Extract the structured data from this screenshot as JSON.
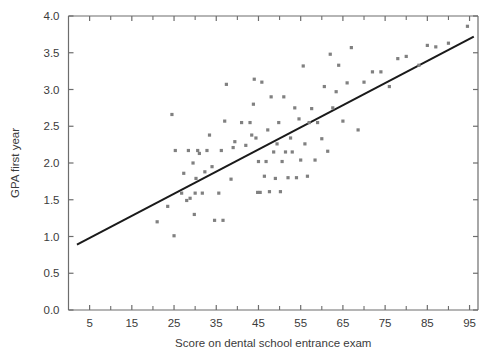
{
  "chart_data": {
    "type": "scatter",
    "title": "",
    "xlabel": "Score on dental school entrance exam",
    "ylabel": "GPA first year",
    "xlim": [
      0,
      97
    ],
    "ylim": [
      0.0,
      4.0
    ],
    "grid": false,
    "legend": null,
    "x_ticks_major": [
      5,
      15,
      25,
      35,
      45,
      55,
      65,
      75,
      85,
      95
    ],
    "x_tick_labels": [
      "5",
      "15",
      "25",
      "35",
      "45",
      "55",
      "65",
      "75",
      "85",
      "95"
    ],
    "x_ticks_minor": [
      10,
      20,
      30,
      40,
      50,
      60,
      70,
      80,
      90
    ],
    "y_ticks": [
      0.0,
      0.5,
      1.0,
      1.5,
      2.0,
      2.5,
      3.0,
      3.5,
      4.0
    ],
    "y_tick_labels": [
      "0.0",
      "0.5",
      "1.0",
      "1.5",
      "2.0",
      "2.5",
      "3.0",
      "3.5",
      "4.0"
    ],
    "point_color": "#808080",
    "line_color": "#1a1a1a",
    "axis_color": "#6d6d6d",
    "trendline": {
      "label": "least squares regression line",
      "x_start": 2.0,
      "y_start": 0.89,
      "x_end": 96.0,
      "y_end": 3.72
    },
    "points": [
      {
        "x": 21.0,
        "y": 1.2
      },
      {
        "x": 23.5,
        "y": 1.41
      },
      {
        "x": 24.5,
        "y": 2.66
      },
      {
        "x": 25.0,
        "y": 1.01
      },
      {
        "x": 25.3,
        "y": 2.17
      },
      {
        "x": 26.8,
        "y": 1.59
      },
      {
        "x": 27.3,
        "y": 1.86
      },
      {
        "x": 28.0,
        "y": 1.49
      },
      {
        "x": 28.4,
        "y": 2.17
      },
      {
        "x": 28.8,
        "y": 1.52
      },
      {
        "x": 29.5,
        "y": 2.0
      },
      {
        "x": 29.8,
        "y": 1.3
      },
      {
        "x": 30.0,
        "y": 1.59
      },
      {
        "x": 30.2,
        "y": 1.79
      },
      {
        "x": 30.6,
        "y": 2.17
      },
      {
        "x": 31.0,
        "y": 2.13
      },
      {
        "x": 31.7,
        "y": 1.59
      },
      {
        "x": 32.3,
        "y": 1.88
      },
      {
        "x": 32.8,
        "y": 2.17
      },
      {
        "x": 33.4,
        "y": 2.38
      },
      {
        "x": 34.0,
        "y": 1.95
      },
      {
        "x": 34.6,
        "y": 1.22
      },
      {
        "x": 35.6,
        "y": 1.59
      },
      {
        "x": 36.2,
        "y": 2.17
      },
      {
        "x": 36.6,
        "y": 1.22
      },
      {
        "x": 37.0,
        "y": 2.57
      },
      {
        "x": 37.4,
        "y": 3.07
      },
      {
        "x": 38.5,
        "y": 1.78
      },
      {
        "x": 39.0,
        "y": 2.21
      },
      {
        "x": 39.4,
        "y": 2.29
      },
      {
        "x": 41.0,
        "y": 2.55
      },
      {
        "x": 42.0,
        "y": 2.24
      },
      {
        "x": 43.0,
        "y": 2.55
      },
      {
        "x": 43.4,
        "y": 2.38
      },
      {
        "x": 43.8,
        "y": 2.8
      },
      {
        "x": 44.0,
        "y": 3.14
      },
      {
        "x": 44.4,
        "y": 2.34
      },
      {
        "x": 44.8,
        "y": 1.6
      },
      {
        "x": 45.0,
        "y": 2.02
      },
      {
        "x": 45.4,
        "y": 1.6
      },
      {
        "x": 45.8,
        "y": 3.1
      },
      {
        "x": 46.4,
        "y": 1.82
      },
      {
        "x": 46.8,
        "y": 2.02
      },
      {
        "x": 47.2,
        "y": 2.45
      },
      {
        "x": 47.6,
        "y": 1.61
      },
      {
        "x": 48.0,
        "y": 2.9
      },
      {
        "x": 48.6,
        "y": 2.15
      },
      {
        "x": 49.0,
        "y": 1.79
      },
      {
        "x": 49.4,
        "y": 2.26
      },
      {
        "x": 49.8,
        "y": 2.55
      },
      {
        "x": 50.2,
        "y": 1.61
      },
      {
        "x": 50.6,
        "y": 2.02
      },
      {
        "x": 51.0,
        "y": 2.9
      },
      {
        "x": 51.4,
        "y": 2.15
      },
      {
        "x": 52.0,
        "y": 1.8
      },
      {
        "x": 52.6,
        "y": 2.34
      },
      {
        "x": 53.0,
        "y": 2.15
      },
      {
        "x": 53.6,
        "y": 2.75
      },
      {
        "x": 54.0,
        "y": 1.8
      },
      {
        "x": 54.6,
        "y": 2.6
      },
      {
        "x": 55.0,
        "y": 2.04
      },
      {
        "x": 55.6,
        "y": 3.32
      },
      {
        "x": 56.0,
        "y": 2.26
      },
      {
        "x": 56.6,
        "y": 1.82
      },
      {
        "x": 57.0,
        "y": 2.55
      },
      {
        "x": 57.6,
        "y": 2.74
      },
      {
        "x": 58.4,
        "y": 2.04
      },
      {
        "x": 59.0,
        "y": 2.55
      },
      {
        "x": 60.0,
        "y": 2.33
      },
      {
        "x": 60.6,
        "y": 3.04
      },
      {
        "x": 61.4,
        "y": 2.16
      },
      {
        "x": 62.0,
        "y": 3.48
      },
      {
        "x": 62.6,
        "y": 2.75
      },
      {
        "x": 63.4,
        "y": 2.97
      },
      {
        "x": 64.0,
        "y": 3.33
      },
      {
        "x": 65.0,
        "y": 2.57
      },
      {
        "x": 66.0,
        "y": 3.09
      },
      {
        "x": 67.0,
        "y": 3.57
      },
      {
        "x": 68.6,
        "y": 2.45
      },
      {
        "x": 70.0,
        "y": 3.1
      },
      {
        "x": 72.0,
        "y": 3.24
      },
      {
        "x": 74.0,
        "y": 3.24
      },
      {
        "x": 76.0,
        "y": 3.04
      },
      {
        "x": 78.0,
        "y": 3.42
      },
      {
        "x": 80.0,
        "y": 3.45
      },
      {
        "x": 83.0,
        "y": 3.33
      },
      {
        "x": 85.0,
        "y": 3.6
      },
      {
        "x": 87.0,
        "y": 3.58
      },
      {
        "x": 90.0,
        "y": 3.63
      },
      {
        "x": 94.5,
        "y": 3.86
      }
    ]
  }
}
